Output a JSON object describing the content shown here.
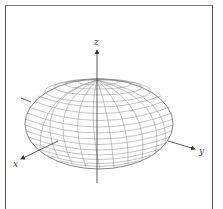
{
  "diagram": {
    "type": "3d-ellipsoid-wireframe",
    "axes": {
      "x_label": "x",
      "y_label": "y",
      "z_label": "z"
    },
    "colors": {
      "frame": "#555555",
      "axis": "#333333",
      "mesh": "#777777",
      "background": "#ffffff"
    }
  }
}
